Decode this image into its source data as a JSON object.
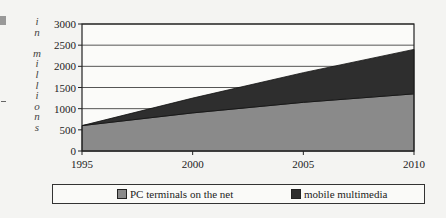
{
  "chart_data": {
    "type": "area",
    "stacked": true,
    "title": "",
    "x": [
      "1995",
      "2000",
      "2005",
      "2010"
    ],
    "series": [
      {
        "name": "PC terminals on the net",
        "values": [
          600,
          900,
          1150,
          1350
        ],
        "color": "#8a8a8a"
      },
      {
        "name": "mobile multimedia",
        "values": [
          0,
          350,
          700,
          1050
        ],
        "color": "#2e2e2e"
      }
    ],
    "stacked_totals": [
      600,
      1250,
      1850,
      2400
    ],
    "xlabel": "",
    "ylabel": "in millions",
    "ylim": [
      0,
      3000
    ],
    "yticks": [
      "0",
      "500",
      "1000",
      "1500",
      "2000",
      "2500",
      "3000"
    ],
    "xticks": [
      "1995",
      "2000",
      "2005",
      "2010"
    ],
    "grid": "horizontal",
    "legend_position": "bottom"
  },
  "axis": {
    "ylabel_letters": [
      "i",
      "n",
      "",
      "m",
      "i",
      "l",
      "l",
      "i",
      "o",
      "n",
      "s"
    ]
  },
  "legend": {
    "items": [
      {
        "label": "PC terminals on the net",
        "color": "#8a8a8a"
      },
      {
        "label": "mobile multimedia",
        "color": "#2e2e2e"
      }
    ]
  }
}
